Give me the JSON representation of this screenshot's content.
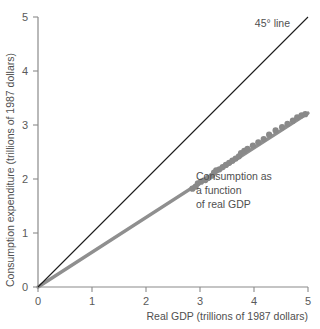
{
  "chart_data": {
    "type": "scatter",
    "title": "",
    "xlabel": "Real GDP (trillions of 1987 dollars)",
    "ylabel": "Consumption expenditure (trillions of 1987 dollars)",
    "xlim": [
      0,
      5
    ],
    "ylim": [
      0,
      5
    ],
    "xticks": [
      "0",
      "1",
      "2",
      "3",
      "4",
      "5"
    ],
    "yticks": [
      "0",
      "1",
      "2",
      "3",
      "4",
      "5"
    ],
    "xtick_values": [
      0,
      1,
      2,
      3,
      4,
      5
    ],
    "ytick_values": [
      0,
      1,
      2,
      3,
      4,
      5
    ],
    "grid": false,
    "legend": "none",
    "series": [
      {
        "name": "Consumption as a function of real GDP",
        "type": "scatter",
        "marker_color": "#898989",
        "points": [
          [
            2.86,
            1.82
          ],
          [
            2.92,
            1.86
          ],
          [
            2.96,
            1.92
          ],
          [
            3.02,
            1.95
          ],
          [
            3.1,
            1.98
          ],
          [
            3.15,
            2.02
          ],
          [
            3.22,
            2.06
          ],
          [
            3.26,
            2.12
          ],
          [
            3.3,
            2.16
          ],
          [
            3.36,
            2.18
          ],
          [
            3.42,
            2.22
          ],
          [
            3.48,
            2.26
          ],
          [
            3.54,
            2.3
          ],
          [
            3.6,
            2.34
          ],
          [
            3.66,
            2.38
          ],
          [
            3.72,
            2.42
          ],
          [
            3.76,
            2.48
          ],
          [
            3.82,
            2.52
          ],
          [
            3.88,
            2.56
          ],
          [
            3.98,
            2.62
          ],
          [
            4.08,
            2.68
          ],
          [
            4.18,
            2.74
          ],
          [
            4.28,
            2.82
          ],
          [
            4.4,
            2.9
          ],
          [
            4.52,
            2.96
          ],
          [
            4.62,
            3.02
          ],
          [
            4.72,
            3.08
          ],
          [
            4.8,
            3.14
          ],
          [
            4.88,
            3.18
          ],
          [
            4.95,
            3.2
          ]
        ]
      },
      {
        "name": "45° line",
        "type": "line",
        "color": "#1b1b1b",
        "x": [
          0,
          5
        ],
        "y": [
          0,
          5
        ]
      },
      {
        "name": "Consumption function line",
        "type": "line",
        "color": "#8f8f8f",
        "x": [
          0,
          5
        ],
        "y": [
          0,
          3.22
        ]
      }
    ],
    "annotations": [
      {
        "name": "forty-five-degree-line",
        "text": "45° line",
        "x": 4.05,
        "y": 4.82
      },
      {
        "name": "consumption-function",
        "lines": [
          "Consumption as",
          "a function",
          "of real GDP"
        ],
        "x": 3.15,
        "y": 2.18
      }
    ]
  },
  "annotations": {
    "forty_five_label": "45° line",
    "consumption_line1": "Consumption as",
    "consumption_line2": "a function",
    "consumption_line3": "of real GDP"
  },
  "axes": {
    "x_title": "Real GDP (trillions of 1987 dollars)",
    "y_title": "Consumption expenditure (trillions of 1987 dollars)",
    "x_tick_0": "0",
    "x_tick_1": "1",
    "x_tick_2": "2",
    "x_tick_3": "3",
    "x_tick_4": "4",
    "x_tick_5": "5",
    "y_tick_0": "0",
    "y_tick_1": "1",
    "y_tick_2": "2",
    "y_tick_3": "3",
    "y_tick_4": "4",
    "y_tick_5": "5"
  },
  "colors": {
    "axis": "#8a8a8a",
    "reference_line": "#1b1b1b",
    "fit_line": "#8f8f8f",
    "marker": "#898989",
    "text": "#4f4f4f",
    "background": "#ffffff"
  }
}
